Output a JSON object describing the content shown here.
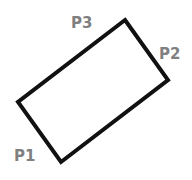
{
  "diagram": {
    "shape": "rotated-rectangle",
    "stroke_color": "#111111",
    "label_color": "#808080",
    "corners": {
      "top": [
        125,
        20
      ],
      "right": [
        168,
        80
      ],
      "bottom": [
        61,
        162
      ],
      "left": [
        18,
        102
      ]
    },
    "labels": {
      "p1": "P1",
      "p2": "P2",
      "p3": "P3"
    }
  }
}
